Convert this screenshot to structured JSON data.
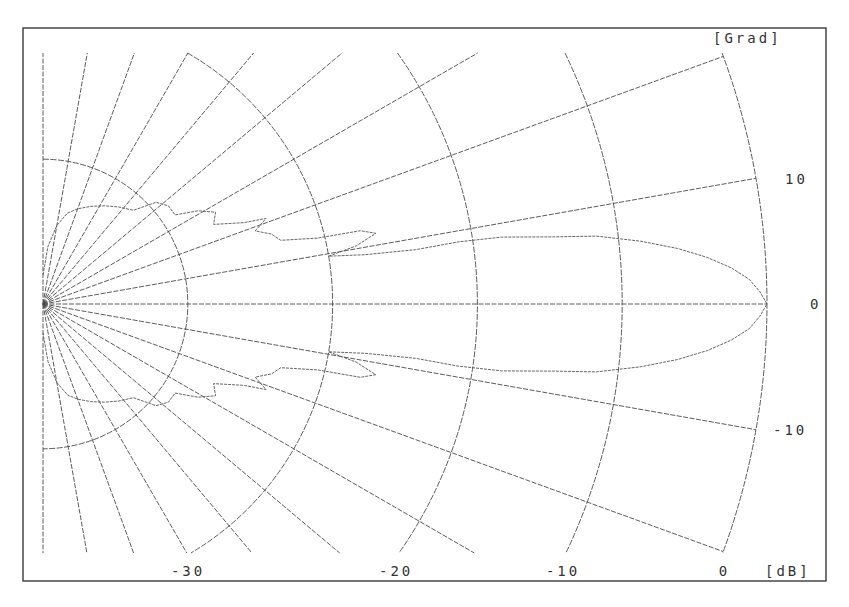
{
  "chart_data": {
    "type": "line",
    "subtype": "polar-half-plane (radiation pattern)",
    "title": "",
    "angle_unit_label": "[Grad]",
    "radius_unit_label": "[dB]",
    "radial_ticks": [
      {
        "db": 0,
        "label": "0"
      },
      {
        "db": -10,
        "label": "-10"
      },
      {
        "db": -20,
        "label": "-20"
      },
      {
        "db": -30,
        "label": "-30"
      },
      {
        "db": -40,
        "label": ""
      }
    ],
    "radial_range_db": [
      -50,
      0
    ],
    "angle_ticks": [
      {
        "deg": 10,
        "label": "10"
      },
      {
        "deg": 0,
        "label": "0"
      },
      {
        "deg": -10,
        "label": "-10"
      }
    ],
    "angle_gridlines_deg": [
      90,
      80,
      70,
      60,
      50,
      40,
      30,
      20,
      10,
      0,
      -10,
      -20,
      -30,
      -40,
      -50,
      -60,
      -70,
      -80,
      -90
    ],
    "angle_range_deg": [
      -90,
      90
    ],
    "series": [
      {
        "name": "radiation pattern",
        "points_deg_db": [
          [
            0,
            0
          ],
          [
            1,
            -0.5
          ],
          [
            2,
            -1.2
          ],
          [
            3,
            -2.4
          ],
          [
            4,
            -4.0
          ],
          [
            5,
            -6.0
          ],
          [
            6,
            -8.5
          ],
          [
            7,
            -11.5
          ],
          [
            7.5,
            -14.5
          ],
          [
            8.3,
            -18
          ],
          [
            8.5,
            -21
          ],
          [
            8.3,
            -24
          ],
          [
            8.7,
            -27.5
          ],
          [
            9.5,
            -30
          ],
          [
            10.5,
            -28
          ],
          [
            12,
            -26.5
          ],
          [
            13,
            -27.5
          ],
          [
            13.5,
            -30.5
          ],
          [
            15,
            -33
          ],
          [
            17,
            -33.5
          ],
          [
            19,
            -34.5
          ],
          [
            21,
            -33.5
          ],
          [
            22,
            -35
          ],
          [
            25,
            -37
          ],
          [
            28,
            -36.5
          ],
          [
            31,
            -37.5
          ],
          [
            34,
            -39
          ],
          [
            38,
            -39
          ],
          [
            42,
            -39.5
          ],
          [
            46,
            -41
          ],
          [
            52,
            -41.5
          ],
          [
            58,
            -42
          ],
          [
            64,
            -42.5
          ],
          [
            70,
            -43
          ],
          [
            75,
            -43.5
          ],
          [
            80,
            -44.5
          ],
          [
            85,
            -46
          ],
          [
            90,
            -48
          ]
        ],
        "symmetric": true
      }
    ],
    "grid": true,
    "legend": "none"
  }
}
